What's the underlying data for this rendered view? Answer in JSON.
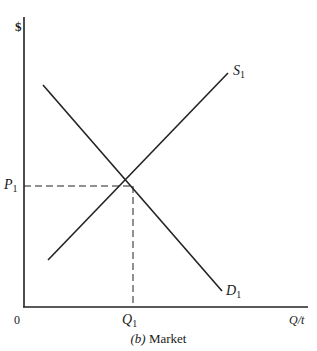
{
  "diagram": {
    "type": "supply-demand",
    "y_axis_label": "$",
    "x_axis_label": "Q/t",
    "origin_label": "0",
    "caption_prefix": "(b)",
    "caption_text": "Market",
    "curves": [
      {
        "name": "S",
        "subscript": "1",
        "kind": "supply"
      },
      {
        "name": "D",
        "subscript": "1",
        "kind": "demand"
      }
    ],
    "equilibrium": {
      "price_label": "P",
      "price_sub": "1",
      "quantity_label": "Q",
      "quantity_sub": "1"
    },
    "colors": {
      "line": "#222222",
      "background": "#ffffff"
    }
  }
}
